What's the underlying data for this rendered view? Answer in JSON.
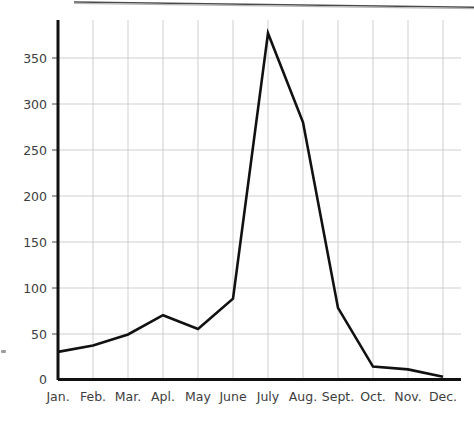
{
  "chart_data": {
    "type": "line",
    "title": "",
    "subtitle": "",
    "xlabel": "",
    "ylabel": "",
    "categories": [
      "Jan.",
      "Feb.",
      "Mar.",
      "Apl.",
      "May",
      "June",
      "July",
      "Aug.",
      "Sept.",
      "Oct.",
      "Nov.",
      "Dec."
    ],
    "values": [
      30,
      37,
      49,
      70,
      55,
      88,
      377,
      280,
      78,
      14,
      11,
      3
    ],
    "series": [
      {
        "name": "",
        "values": [
          30,
          37,
          49,
          70,
          55,
          88,
          377,
          280,
          78,
          14,
          11,
          3
        ]
      }
    ],
    "ylim": [
      0,
      390
    ],
    "xlim": [
      0,
      12
    ],
    "y_ticks": [
      0,
      50,
      100,
      150,
      200,
      250,
      300,
      350
    ],
    "y_tick_labels": [
      "0",
      "50",
      "100",
      "150",
      "200",
      "250",
      "300",
      "350"
    ],
    "x_tick_labels": [
      "Jan.",
      "Feb.",
      "Mar.",
      "Apl.",
      "May",
      "June",
      "July",
      "Aug.",
      "Sept.",
      "Oct.",
      "Nov.",
      "Dec."
    ],
    "grid": true,
    "grid_axes": "both",
    "legend": false,
    "legend_position": "none",
    "line_color": "#111111",
    "line_width": 2.6,
    "grid_color": "#c9c9c9",
    "axis_color": "#111111",
    "background_color": "#ffffff",
    "text_color": "#3d3d3d",
    "annotations": []
  },
  "axes": {
    "y_axis_name": "y-axis",
    "x_axis_name": "x-axis"
  },
  "artifacts": {
    "page_edge_name": "scan-page-edge",
    "speck_name": "scan-speck"
  }
}
